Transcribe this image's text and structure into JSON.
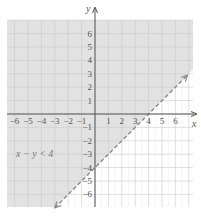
{
  "chart_data": {
    "type": "inequality-graph",
    "title": "",
    "inequality": "x − y < 4",
    "boundary": {
      "equation": "y = x - 4",
      "style": "dashed",
      "points": [
        [
          4,
          0
        ],
        [
          0,
          -4
        ]
      ]
    },
    "shaded_region": "above boundary line (y > x - 4)",
    "xlabel": "x",
    "ylabel": "y",
    "xlim": [
      -7,
      7
    ],
    "ylim": [
      -7,
      7
    ],
    "x_ticks": [
      "-6",
      "-5",
      "-4",
      "-3",
      "-2",
      "-1",
      "1",
      "2",
      "3",
      "4",
      "5",
      "6"
    ],
    "y_ticks": [
      "6",
      "5",
      "4",
      "3",
      "2",
      "1",
      "-1",
      "-2",
      "-3",
      "-4",
      "-5",
      "-6"
    ],
    "grid": true
  },
  "colors": {
    "shade": "#e2e2e2",
    "grid": "#c9c9c9",
    "grid_unshaded": "#e6e6e6",
    "axis": "#555555",
    "boundary": "#8a8a8a"
  },
  "labels": {
    "x_axis": "x",
    "y_axis": "y",
    "inequality": "x − y < 4"
  }
}
